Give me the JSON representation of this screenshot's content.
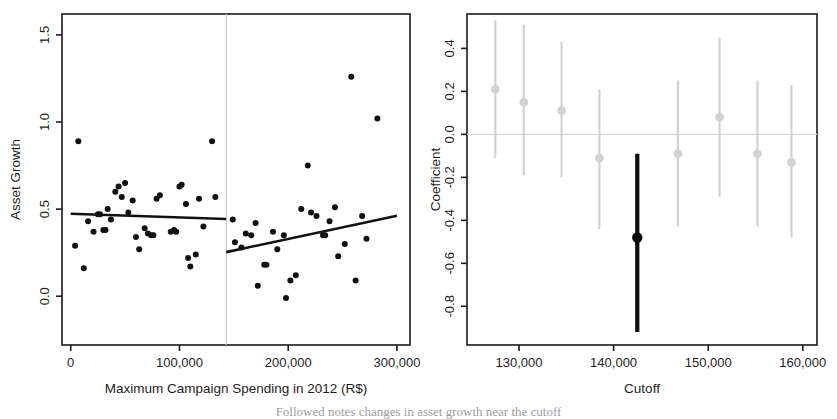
{
  "figure": {
    "caption_fragment": "Followed notes changes in asset growth near the cutoff"
  },
  "chart_data": [
    {
      "panel": "left",
      "type": "scatter",
      "title": "",
      "xlabel": "Maximum Campaign Spending in 2012 (R$)",
      "ylabel": "Asset Growth",
      "xlim": [
        -8000,
        312000
      ],
      "ylim": [
        -0.28,
        1.62
      ],
      "xticks": [
        0,
        100000,
        200000,
        300000
      ],
      "xticklabels": [
        "0",
        "100,000",
        "200,000",
        "300,000"
      ],
      "yticks": [
        0.0,
        0.5,
        1.0,
        1.5
      ],
      "yticklabels": [
        "0.0",
        "0.5",
        "1.0",
        "1.5"
      ],
      "grid": false,
      "legend": "none",
      "cutoff": 143000,
      "cutoff_line_color": "#cccccc",
      "point_color": "#111111",
      "line_color": "#111111",
      "points": [
        [
          7000,
          0.89
        ],
        [
          4000,
          0.29
        ],
        [
          12000,
          0.16
        ],
        [
          16000,
          0.43
        ],
        [
          21000,
          0.37
        ],
        [
          25000,
          0.47
        ],
        [
          27000,
          0.47
        ],
        [
          30000,
          0.38
        ],
        [
          32000,
          0.38
        ],
        [
          34000,
          0.5
        ],
        [
          37000,
          0.44
        ],
        [
          41000,
          0.6
        ],
        [
          44000,
          0.63
        ],
        [
          47000,
          0.57
        ],
        [
          50000,
          0.65
        ],
        [
          53000,
          0.48
        ],
        [
          57000,
          0.55
        ],
        [
          60000,
          0.34
        ],
        [
          63000,
          0.27
        ],
        [
          68000,
          0.39
        ],
        [
          71000,
          0.36
        ],
        [
          74000,
          0.35
        ],
        [
          76000,
          0.35
        ],
        [
          79000,
          0.56
        ],
        [
          82000,
          0.58
        ],
        [
          92000,
          0.37
        ],
        [
          95000,
          0.38
        ],
        [
          97000,
          0.37
        ],
        [
          100000,
          0.63
        ],
        [
          102000,
          0.64
        ],
        [
          106000,
          0.53
        ],
        [
          108000,
          0.22
        ],
        [
          110000,
          0.17
        ],
        [
          115000,
          0.24
        ],
        [
          118000,
          0.56
        ],
        [
          122000,
          0.4
        ],
        [
          130000,
          0.89
        ],
        [
          133000,
          0.57
        ],
        [
          149000,
          0.44
        ],
        [
          151000,
          0.31
        ],
        [
          157000,
          0.28
        ],
        [
          161000,
          0.36
        ],
        [
          166000,
          0.35
        ],
        [
          170000,
          0.42
        ],
        [
          172000,
          0.06
        ],
        [
          178000,
          0.18
        ],
        [
          180000,
          0.18
        ],
        [
          186000,
          0.37
        ],
        [
          190000,
          0.27
        ],
        [
          196000,
          0.35
        ],
        [
          198000,
          -0.01
        ],
        [
          202000,
          0.09
        ],
        [
          207000,
          0.12
        ],
        [
          212000,
          0.5
        ],
        [
          218000,
          0.75
        ],
        [
          221000,
          0.48
        ],
        [
          226000,
          0.46
        ],
        [
          232000,
          0.35
        ],
        [
          234000,
          0.35
        ],
        [
          238000,
          0.43
        ],
        [
          243000,
          0.51
        ],
        [
          246000,
          0.23
        ],
        [
          252000,
          0.3
        ],
        [
          258000,
          1.26
        ],
        [
          262000,
          0.09
        ],
        [
          268000,
          0.46
        ],
        [
          272000,
          0.33
        ],
        [
          282000,
          1.02
        ]
      ],
      "fit_left": {
        "x0": 0,
        "y0": 0.473,
        "x1": 143000,
        "y1": 0.443
      },
      "fit_right": {
        "x0": 143000,
        "y0": 0.253,
        "x1": 300000,
        "y1": 0.462
      }
    },
    {
      "panel": "right",
      "type": "scatter",
      "title": "",
      "xlabel": "Cutoff",
      "ylabel": "Coefficient",
      "xlim": [
        124500,
        161500
      ],
      "ylim": [
        -0.98,
        0.56
      ],
      "xticks": [
        130000,
        140000,
        150000,
        160000
      ],
      "xticklabels": [
        "130,000",
        "140,000",
        "150,000",
        "160,000"
      ],
      "yticks": [
        0.4,
        0.2,
        0.0,
        -0.2,
        -0.4,
        -0.6,
        -0.8
      ],
      "yticklabels": [
        "0.4",
        "0.2",
        "0.0",
        "-0.2",
        "-0.4",
        "-0.6",
        "-0.8"
      ],
      "grid": false,
      "legend": "none",
      "zero_line": 0.0,
      "zero_line_color": "#d8d8d8",
      "muted_color": "#d2d2d2",
      "highlight_color": "#0d0d0d",
      "estimates": [
        {
          "cutoff": 127500,
          "coef": 0.21,
          "lo": -0.11,
          "hi": 0.53,
          "highlight": false
        },
        {
          "cutoff": 130500,
          "coef": 0.15,
          "lo": -0.19,
          "hi": 0.51,
          "highlight": false
        },
        {
          "cutoff": 134500,
          "coef": 0.11,
          "lo": -0.2,
          "hi": 0.43,
          "highlight": false
        },
        {
          "cutoff": 138500,
          "coef": -0.11,
          "lo": -0.44,
          "hi": 0.21,
          "highlight": false
        },
        {
          "cutoff": 142500,
          "coef": -0.48,
          "lo": -0.92,
          "hi": -0.09,
          "highlight": true
        },
        {
          "cutoff": 146800,
          "coef": -0.09,
          "lo": -0.43,
          "hi": 0.25,
          "highlight": false
        },
        {
          "cutoff": 151200,
          "coef": 0.08,
          "lo": -0.29,
          "hi": 0.45,
          "highlight": false
        },
        {
          "cutoff": 155200,
          "coef": -0.09,
          "lo": -0.43,
          "hi": 0.25,
          "highlight": false
        },
        {
          "cutoff": 158800,
          "coef": -0.13,
          "lo": -0.48,
          "hi": 0.23,
          "highlight": false
        }
      ]
    }
  ]
}
